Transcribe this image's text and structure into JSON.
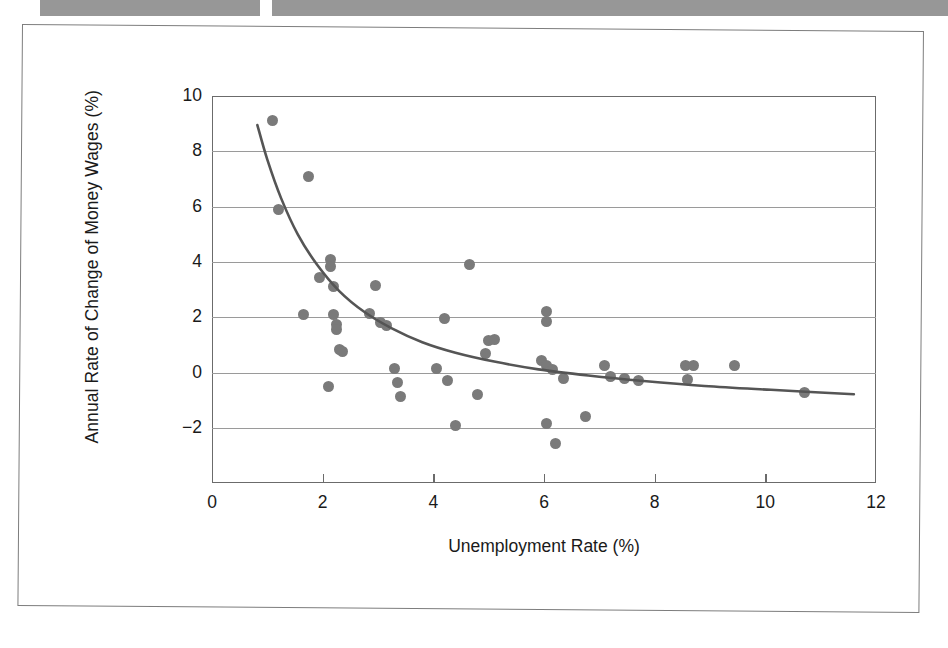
{
  "page": {
    "scan_bar_left_label": "scan-artifact-bar-left",
    "scan_bar_right_label": "scan-artifact-bar-right",
    "frame_label": "scanned-page-border"
  },
  "chart_data": {
    "type": "scatter",
    "title": "",
    "xlabel": "Unemployment Rate (%)",
    "ylabel": "Annual Rate of Change of Money Wages (%)",
    "xlim": [
      0,
      12
    ],
    "ylim": [
      -3,
      10
    ],
    "xticks": [
      0,
      2,
      4,
      6,
      8,
      10,
      12
    ],
    "yticks": [
      10,
      8,
      6,
      4,
      2,
      0,
      -2
    ],
    "grid": "horizontal",
    "legend": "none",
    "marker_color": "#7a7a7a",
    "curve_color": "#555555",
    "axis_color": "#6b6b6b",
    "points": [
      {
        "x": 1.1,
        "y": 9.1
      },
      {
        "x": 1.75,
        "y": 7.1
      },
      {
        "x": 1.2,
        "y": 5.9
      },
      {
        "x": 1.95,
        "y": 3.45
      },
      {
        "x": 2.15,
        "y": 4.1
      },
      {
        "x": 2.15,
        "y": 3.85
      },
      {
        "x": 2.2,
        "y": 3.1
      },
      {
        "x": 2.95,
        "y": 3.15
      },
      {
        "x": 4.65,
        "y": 3.9
      },
      {
        "x": 1.65,
        "y": 2.1
      },
      {
        "x": 2.2,
        "y": 2.1
      },
      {
        "x": 2.25,
        "y": 1.75
      },
      {
        "x": 2.25,
        "y": 1.55
      },
      {
        "x": 2.3,
        "y": 0.85
      },
      {
        "x": 2.35,
        "y": 0.75
      },
      {
        "x": 2.85,
        "y": 2.15
      },
      {
        "x": 3.05,
        "y": 1.8
      },
      {
        "x": 3.15,
        "y": 1.7
      },
      {
        "x": 4.2,
        "y": 1.95
      },
      {
        "x": 5.0,
        "y": 1.15
      },
      {
        "x": 5.1,
        "y": 1.2
      },
      {
        "x": 4.95,
        "y": 0.7
      },
      {
        "x": 6.05,
        "y": 2.2
      },
      {
        "x": 6.05,
        "y": 1.85
      },
      {
        "x": 5.95,
        "y": 0.45
      },
      {
        "x": 6.05,
        "y": 0.25
      },
      {
        "x": 6.15,
        "y": 0.1
      },
      {
        "x": 6.35,
        "y": -0.2
      },
      {
        "x": 2.1,
        "y": -0.5
      },
      {
        "x": 3.3,
        "y": 0.15
      },
      {
        "x": 3.35,
        "y": -0.35
      },
      {
        "x": 3.4,
        "y": -0.85
      },
      {
        "x": 4.05,
        "y": 0.15
      },
      {
        "x": 4.25,
        "y": -0.3
      },
      {
        "x": 4.8,
        "y": -0.8
      },
      {
        "x": 7.1,
        "y": 0.25
      },
      {
        "x": 7.2,
        "y": -0.15
      },
      {
        "x": 7.45,
        "y": -0.2
      },
      {
        "x": 7.7,
        "y": -0.3
      },
      {
        "x": 8.55,
        "y": 0.25
      },
      {
        "x": 8.7,
        "y": 0.25
      },
      {
        "x": 8.6,
        "y": -0.25
      },
      {
        "x": 9.45,
        "y": 0.25
      },
      {
        "x": 10.7,
        "y": -0.7
      },
      {
        "x": 4.4,
        "y": -1.9
      },
      {
        "x": 6.05,
        "y": -1.85
      },
      {
        "x": 6.2,
        "y": -2.55
      },
      {
        "x": 6.75,
        "y": -1.6
      }
    ],
    "fitted_curve": {
      "label": "fitted-phillips-curve",
      "points": [
        {
          "x": 0.82,
          "y": 8.95
        },
        {
          "x": 1.0,
          "y": 7.7
        },
        {
          "x": 1.25,
          "y": 6.3
        },
        {
          "x": 1.55,
          "y": 5.0
        },
        {
          "x": 1.9,
          "y": 3.9
        },
        {
          "x": 2.3,
          "y": 2.95
        },
        {
          "x": 2.75,
          "y": 2.2
        },
        {
          "x": 3.25,
          "y": 1.6
        },
        {
          "x": 3.8,
          "y": 1.1
        },
        {
          "x": 4.4,
          "y": 0.72
        },
        {
          "x": 5.1,
          "y": 0.4
        },
        {
          "x": 5.9,
          "y": 0.12
        },
        {
          "x": 6.8,
          "y": -0.1
        },
        {
          "x": 7.8,
          "y": -0.3
        },
        {
          "x": 8.9,
          "y": -0.48
        },
        {
          "x": 10.1,
          "y": -0.62
        },
        {
          "x": 11.6,
          "y": -0.78
        }
      ]
    }
  }
}
